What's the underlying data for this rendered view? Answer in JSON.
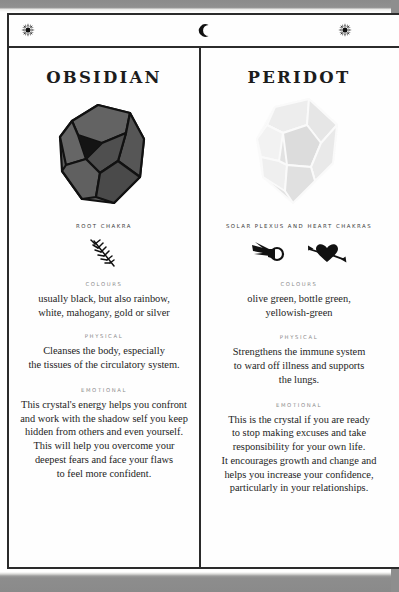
{
  "page": {
    "frame_color": "#2b2b2b",
    "background": "#ffffff",
    "scan_band_color": "#8e8e8e"
  },
  "header": {
    "left_icon": "sunburst-icon",
    "center_icon": "crescent-moon-icon",
    "right_icon": "sunburst-icon",
    "center_glyph": "☾"
  },
  "columns": [
    {
      "title": "OBSIDIAN",
      "gem": {
        "name": "obsidian-gem-illustration",
        "fill": "#5d5d5d",
        "edge": "#111111",
        "shade": "#3a3a3a"
      },
      "chakra": {
        "label": "ROOT\nCHAKRA",
        "symbols": [
          "feather-sprig-icon"
        ]
      },
      "sections": [
        {
          "label": "COLOURS",
          "body": "usually black, but also rainbow,\nwhite, mahogany, gold or silver"
        },
        {
          "label": "PHYSICAL",
          "body": "Cleanses the body, especially\nthe tissues of the circulatory system."
        },
        {
          "label": "EMOTIONAL",
          "body": "This crystal's energy helps you confront\nand work with the shadow self you keep\nhidden from others and even yourself.\nThis will help you overcome your\ndeepest fears and face your flaws\nto feel more confident."
        }
      ]
    },
    {
      "title": "PERIDOT",
      "gem": {
        "name": "peridot-gem-illustration",
        "fill": "#e4e4e4",
        "edge": "#f7f7f7",
        "shade": "#d2d2d2"
      },
      "chakra": {
        "label": "SOLAR PLEXUS\nAND HEART CHAKRAS",
        "symbols": [
          "comet-flame-icon",
          "heart-with-arrow-icon"
        ]
      },
      "sections": [
        {
          "label": "COLOURS",
          "body": "olive green, bottle green,\nyellowish-green"
        },
        {
          "label": "PHYSICAL",
          "body": "Strengthens the immune system\nto ward off illness and supports\nthe lungs."
        },
        {
          "label": "EMOTIONAL",
          "body": "This is the crystal if you are ready\nto stop making excuses and take\nresponsibility for your own life.\nIt encourages growth and change and\nhelps you increase your confidence,\nparticularly in your relationships."
        }
      ]
    }
  ]
}
